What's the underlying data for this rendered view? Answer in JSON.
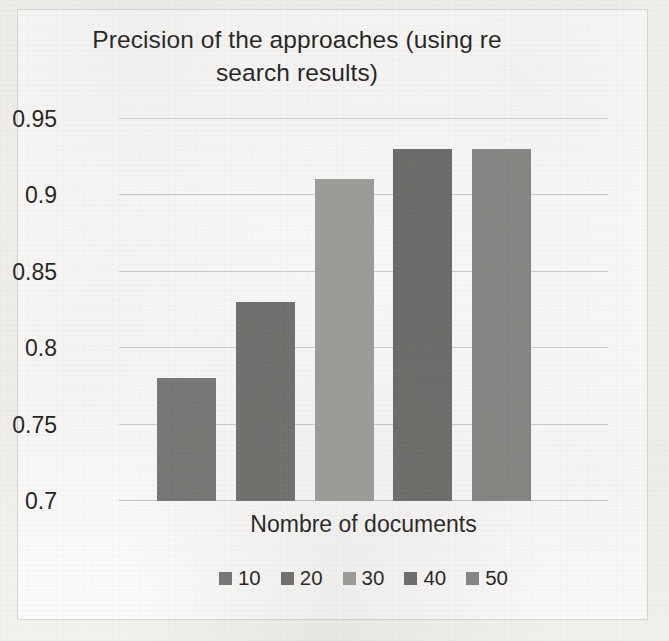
{
  "chart_data": {
    "type": "bar",
    "title": "Precision of the approaches (using re search results)",
    "title_lines": [
      "Precision of the approaches (using re",
      "search results)"
    ],
    "xlabel": "Nombre of documents",
    "ylabel": "",
    "categories": [
      "10",
      "20",
      "30",
      "40",
      "50"
    ],
    "values": [
      0.78,
      0.83,
      0.91,
      0.93,
      0.93
    ],
    "ylim": [
      0.7,
      0.95
    ],
    "ytick_labels": [
      "0.95",
      "0.9",
      "0.85",
      "0.8",
      "0.75",
      "0.7"
    ],
    "ytick_values": [
      0.95,
      0.9,
      0.85,
      0.8,
      0.75,
      0.7
    ],
    "grid": true,
    "legend_position": "bottom",
    "series": [
      {
        "name": "10",
        "value": 0.78,
        "color": "#767472"
      },
      {
        "name": "20",
        "value": 0.83,
        "color": "#6e6c6a"
      },
      {
        "name": "30",
        "value": 0.91,
        "color": "#9d9b98"
      },
      {
        "name": "40",
        "value": 0.93,
        "color": "#6a6866"
      },
      {
        "name": "50",
        "value": 0.93,
        "color": "#858381"
      }
    ]
  },
  "legend": {
    "items": [
      {
        "label": "10",
        "color": "#767472"
      },
      {
        "label": "20",
        "color": "#6e6c6a"
      },
      {
        "label": "30",
        "color": "#9d9b98"
      },
      {
        "label": "40",
        "color": "#6a6866"
      },
      {
        "label": "50",
        "color": "#858381"
      }
    ]
  },
  "colors": {
    "background": "#f3f2ef",
    "plot_background": "#fcfbfa",
    "gridline": "#cfcdc9",
    "text": "#1b1b1b",
    "frame_border": "#d9d7d2"
  }
}
